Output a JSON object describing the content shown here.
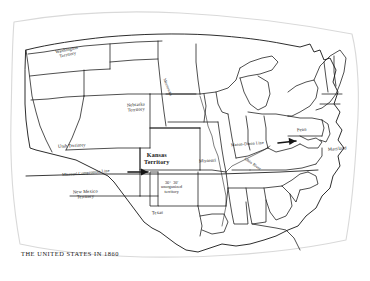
{
  "map": {
    "title": "THE UNITED STATES IN 1860",
    "ink_color": "#151515",
    "paper_color": "#ffffff",
    "labels": {
      "washington_territory": "Washington\nTerritory",
      "nebraska_territory": "Nebraska\nTerritory",
      "utah_territory": "Utah Territory",
      "new_mexico_territory": "New Mexico\nTerritory",
      "kansas_territory": "Kansas\nTerritory",
      "missouri": "Missouri",
      "minnesota": "Minnesota",
      "texas": "Texas",
      "penn": "Penn",
      "maryland": "Maryland",
      "ohio_river": "Ohio River",
      "mason_dixon_line": "Mason-Dixon Line",
      "missouri_compromise_line": "Missouri Compromise Line",
      "unorganized_territory": "36°  30'\nunorganized\nterritory"
    },
    "annotations": [
      {
        "name": "missouri-compromise-arrow",
        "kind": "arrow",
        "points_to": "Kansas Territory southern border"
      },
      {
        "name": "mason-dixon-arrow",
        "kind": "arrow",
        "points_to": "Pennsylvania / Maryland border"
      }
    ]
  }
}
